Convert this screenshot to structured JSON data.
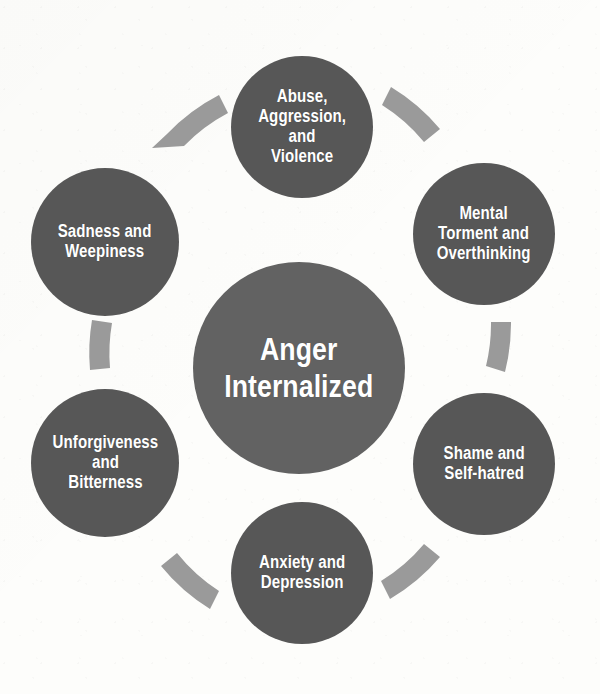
{
  "diagram": {
    "type": "cycle",
    "title": "Anger Internalized",
    "background_color": "#fdfdfb",
    "center": {
      "label": "Anger\nInternalized",
      "color": "#626262",
      "text_color": "#ffffff"
    },
    "connector": {
      "name": "curved-arrow-connector",
      "color": "#9a9a9a",
      "count": 6
    },
    "nodes": [
      {
        "id": "abuse",
        "label": "Abuse,\nAggression,\nand\nViolence",
        "position": "top",
        "color": "#575757",
        "text_color": "#ffffff"
      },
      {
        "id": "mental",
        "label": "Mental\nTorment and\nOverthinking",
        "position": "top-right",
        "color": "#575757",
        "text_color": "#ffffff"
      },
      {
        "id": "shame",
        "label": "Shame and\nSelf-hatred",
        "position": "bottom-right",
        "color": "#575757",
        "text_color": "#ffffff"
      },
      {
        "id": "anxiety",
        "label": "Anxiety and\nDepression",
        "position": "bottom",
        "color": "#575757",
        "text_color": "#ffffff"
      },
      {
        "id": "unforgiveness",
        "label": "Unforgiveness\nand\nBitterness",
        "position": "bottom-left",
        "color": "#575757",
        "text_color": "#ffffff"
      },
      {
        "id": "sadness",
        "label": "Sadness and\nWeepiness",
        "position": "top-left",
        "color": "#575757",
        "text_color": "#ffffff"
      }
    ]
  }
}
